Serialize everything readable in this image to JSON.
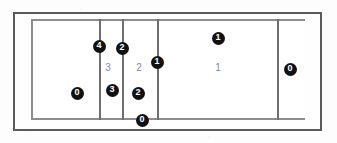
{
  "figure": {
    "type": "court-diagram",
    "colors": {
      "page_background": "#fdfdfd",
      "outer_frame": "#5a5a5a",
      "court_line": "#8d8d8d",
      "zone_line": "#6f6f6f",
      "filled_marker_fill": "#111111",
      "filled_marker_text": "#ffffff",
      "plain_marker_text": "#8a8a8a"
    }
  },
  "court": {
    "left": 31,
    "top": 19,
    "width": 274,
    "height": 101
  },
  "zone_lines": [
    {
      "name": "zone-line-1",
      "x": 99,
      "top": 19,
      "height": 101
    },
    {
      "name": "zone-line-2",
      "x": 122,
      "top": 19,
      "height": 101
    },
    {
      "name": "zone-line-3",
      "x": 157,
      "top": 19,
      "height": 101
    },
    {
      "name": "zone-line-4",
      "x": 277,
      "top": 19,
      "height": 101
    }
  ],
  "markers": [
    {
      "name": "marker-filled-4",
      "label": "4",
      "style": "filled",
      "x": 99,
      "y": 46
    },
    {
      "name": "marker-filled-2a",
      "label": "2",
      "style": "filled",
      "x": 122,
      "y": 48
    },
    {
      "name": "marker-filled-1a",
      "label": "1",
      "style": "filled",
      "x": 157,
      "y": 62
    },
    {
      "name": "marker-filled-1b",
      "label": "1",
      "style": "filled",
      "x": 218,
      "y": 38
    },
    {
      "name": "marker-filled-0a",
      "label": "0",
      "style": "filled",
      "x": 290,
      "y": 69
    },
    {
      "name": "marker-filled-0b",
      "label": "0",
      "style": "filled",
      "x": 77,
      "y": 93
    },
    {
      "name": "marker-filled-3",
      "label": "3",
      "style": "filled",
      "x": 112,
      "y": 90
    },
    {
      "name": "marker-filled-2b",
      "label": "2",
      "style": "filled",
      "x": 138,
      "y": 93
    },
    {
      "name": "marker-filled-0c",
      "label": "0",
      "style": "filled",
      "x": 142,
      "y": 120
    },
    {
      "name": "marker-plain-3",
      "label": "3",
      "style": "plain",
      "x": 108,
      "y": 68
    },
    {
      "name": "marker-plain-2",
      "label": "2",
      "style": "plain",
      "x": 139,
      "y": 68
    },
    {
      "name": "marker-plain-1",
      "label": "1",
      "style": "plain",
      "x": 218,
      "y": 68
    }
  ]
}
